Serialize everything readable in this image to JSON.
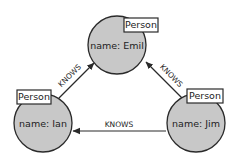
{
  "diagram": {
    "type": "graph",
    "nodes": [
      {
        "id": "emil",
        "label": "Person",
        "property": "name: Emil"
      },
      {
        "id": "ian",
        "label": "Person",
        "property": "name: Ian"
      },
      {
        "id": "jim",
        "label": "Person",
        "property": "name: Jim"
      }
    ],
    "edges": [
      {
        "from": "ian",
        "to": "emil",
        "label": "KNOWS"
      },
      {
        "from": "jim",
        "to": "emil",
        "label": "KNOWS"
      },
      {
        "from": "jim",
        "to": "ian",
        "label": "KNOWS"
      }
    ]
  },
  "colors": {
    "node_fill": "#c8c8c8",
    "stroke": "#2a2a2a",
    "label_fill": "#ffffff"
  }
}
